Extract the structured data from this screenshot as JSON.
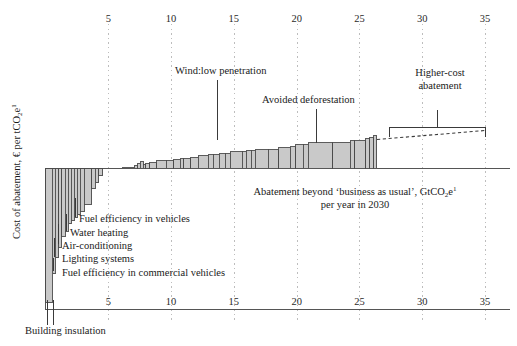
{
  "axes": {
    "y_title_parts": {
      "main": "Cost of abatement, € per tCO",
      "sub": "2",
      "tail": "e",
      "sup": "1"
    },
    "y_title_plain": "Cost of abatement, € per tCO2e1",
    "x_title_line1_a": "Abatement beyond ‘business as usual’, GtCO",
    "x_title_line1_sub": "2",
    "x_title_line1_b": "e",
    "x_title_line1_sup": "1",
    "x_title_line2": "per year in 2030",
    "x_title_plain": "Abatement beyond 'business as usual', GtCO2e1 per year in 2030",
    "top_ticks": [
      "5",
      "10",
      "15",
      "20",
      "25",
      "30",
      "35"
    ],
    "bottom_ticks": [
      "5",
      "10",
      "15",
      "20",
      "25",
      "30",
      "35"
    ],
    "tick_values": [
      5,
      10,
      15,
      20,
      25,
      30,
      35
    ],
    "x_min": 0,
    "x_max": 35
  },
  "annotations": {
    "wind": "Wind:low penetration",
    "deforestation": "Avoided deforestation",
    "higher_cost_line1": "Higher-cost",
    "higher_cost_line2": "abatement"
  },
  "callouts": [
    {
      "label": "Fuel efficiency in vehicles"
    },
    {
      "label": "Water heating"
    },
    {
      "label": "Air-conditioning"
    },
    {
      "label": "Lighting systems"
    },
    {
      "label": "Fuel efficiency in commercial vehicles"
    },
    {
      "label": "Building insulation"
    }
  ],
  "colors": {
    "bar_fill": "#c9c9c9",
    "bar_stroke": "#4a4a4a",
    "axis": "#555555",
    "grid": "#bdbdbd",
    "text": "#1a1a1a",
    "dashed": "#3a3a3a"
  },
  "chart_data": {
    "type": "bar",
    "title": "",
    "subtitle": "",
    "xlabel": "Abatement beyond 'business as usual', GtCO2e per year in 2030",
    "ylabel": "Cost of abatement, € per tCO2e",
    "xlim": [
      0,
      35
    ],
    "ylim": [
      -150,
      45
    ],
    "grid": true,
    "legend": null,
    "note": "Marginal GHG abatement cost curve. Each bar: width = abatement potential (GtCO2e/yr), height = cost (€/tCO2e). Negative-cost (profitable) measures at left.",
    "bars": [
      {
        "name": "Building insulation",
        "x0": 0.0,
        "width": 0.55,
        "cost": -150
      },
      {
        "name": "unnamed-2",
        "x0": 0.55,
        "width": 0.22,
        "cost": -118
      },
      {
        "name": "Fuel efficiency in commercial vehicles",
        "x0": 0.77,
        "width": 0.3,
        "cost": -100
      },
      {
        "name": "unnamed-4",
        "x0": 1.07,
        "width": 0.22,
        "cost": -88
      },
      {
        "name": "Lighting systems",
        "x0": 1.29,
        "width": 0.3,
        "cost": -76
      },
      {
        "name": "unnamed-6",
        "x0": 1.59,
        "width": 0.22,
        "cost": -70
      },
      {
        "name": "Air-conditioning",
        "x0": 1.81,
        "width": 0.26,
        "cost": -62
      },
      {
        "name": "unnamed-8",
        "x0": 2.07,
        "width": 0.2,
        "cost": -58
      },
      {
        "name": "Water heating",
        "x0": 2.27,
        "width": 0.26,
        "cost": -55
      },
      {
        "name": "unnamed-10",
        "x0": 2.53,
        "width": 0.22,
        "cost": -52
      },
      {
        "name": "unnamed-11",
        "x0": 2.75,
        "width": 0.34,
        "cost": -48
      },
      {
        "name": "Fuel efficiency in vehicles",
        "x0": 3.09,
        "width": 0.6,
        "cost": -40
      },
      {
        "name": "unnamed-13",
        "x0": 3.69,
        "width": 0.26,
        "cost": -22
      },
      {
        "name": "unnamed-14",
        "x0": 3.95,
        "width": 0.3,
        "cost": -16
      },
      {
        "name": "unnamed-15",
        "x0": 4.25,
        "width": 0.3,
        "cost": -8
      },
      {
        "name": "unnamed-16",
        "x0": 6.1,
        "width": 0.95,
        "cost": 1
      },
      {
        "name": "unnamed-17",
        "x0": 7.05,
        "width": 0.28,
        "cost": 3
      },
      {
        "name": "unnamed-18",
        "x0": 7.33,
        "width": 0.22,
        "cost": 5
      },
      {
        "name": "unnamed-19",
        "x0": 7.55,
        "width": 0.22,
        "cost": 7
      },
      {
        "name": "unnamed-20",
        "x0": 7.77,
        "width": 0.2,
        "cost": 4
      },
      {
        "name": "unnamed-21",
        "x0": 7.97,
        "width": 0.35,
        "cost": 5
      },
      {
        "name": "unnamed-22",
        "x0": 8.32,
        "width": 0.55,
        "cost": 6
      },
      {
        "name": "unnamed-23",
        "x0": 8.87,
        "width": 0.75,
        "cost": 8
      },
      {
        "name": "unnamed-24",
        "x0": 9.62,
        "width": 0.6,
        "cost": 8
      },
      {
        "name": "unnamed-25",
        "x0": 10.22,
        "width": 0.5,
        "cost": 9
      },
      {
        "name": "unnamed-26",
        "x0": 10.72,
        "width": 0.28,
        "cost": 10
      },
      {
        "name": "unnamed-27",
        "x0": 11.0,
        "width": 0.55,
        "cost": 10
      },
      {
        "name": "unnamed-28",
        "x0": 11.55,
        "width": 0.62,
        "cost": 11
      },
      {
        "name": "unnamed-29",
        "x0": 12.17,
        "width": 0.8,
        "cost": 13
      },
      {
        "name": "unnamed-30",
        "x0": 12.97,
        "width": 0.4,
        "cost": 14
      },
      {
        "name": "unnamed-31",
        "x0": 13.37,
        "width": 0.45,
        "cost": 14
      },
      {
        "name": "unnamed-32",
        "x0": 13.82,
        "width": 0.48,
        "cost": 15
      },
      {
        "name": "unnamed-33",
        "x0": 14.3,
        "width": 0.42,
        "cost": 15
      },
      {
        "name": "Wind:low penetration",
        "x0": 14.72,
        "width": 0.95,
        "cost": 17
      },
      {
        "name": "unnamed-35",
        "x0": 15.67,
        "width": 0.3,
        "cost": 17
      },
      {
        "name": "unnamed-36",
        "x0": 15.97,
        "width": 0.42,
        "cost": 18
      },
      {
        "name": "unnamed-37",
        "x0": 16.39,
        "width": 0.3,
        "cost": 18
      },
      {
        "name": "unnamed-38",
        "x0": 16.69,
        "width": 1.05,
        "cost": 19
      },
      {
        "name": "unnamed-39",
        "x0": 17.74,
        "width": 0.85,
        "cost": 19
      },
      {
        "name": "unnamed-40",
        "x0": 18.59,
        "width": 0.9,
        "cost": 21
      },
      {
        "name": "unnamed-41",
        "x0": 19.49,
        "width": 0.42,
        "cost": 22
      },
      {
        "name": "unnamed-42",
        "x0": 19.91,
        "width": 0.6,
        "cost": 24
      },
      {
        "name": "unnamed-43",
        "x0": 20.51,
        "width": 0.4,
        "cost": 24
      },
      {
        "name": "Avoided deforestation",
        "x0": 20.91,
        "width": 1.95,
        "cost": 26
      },
      {
        "name": "unnamed-45",
        "x0": 22.86,
        "width": 1.4,
        "cost": 26
      },
      {
        "name": "unnamed-46",
        "x0": 24.26,
        "width": 0.35,
        "cost": 28
      },
      {
        "name": "unnamed-47",
        "x0": 24.61,
        "width": 0.9,
        "cost": 28
      },
      {
        "name": "unnamed-48",
        "x0": 25.51,
        "width": 0.3,
        "cost": 30
      },
      {
        "name": "unnamed-49",
        "x0": 25.81,
        "width": 0.35,
        "cost": 31
      },
      {
        "name": "unnamed-50",
        "x0": 26.16,
        "width": 0.22,
        "cost": 33
      }
    ],
    "higher_cost_trend": {
      "type": "dashed-line",
      "x_start": 26.4,
      "y_start": 29,
      "x_end": 35.0,
      "y_end": 38,
      "bracket_x_start": 27.4,
      "bracket_x_end": 35.0,
      "bracket_y": 41
    }
  }
}
